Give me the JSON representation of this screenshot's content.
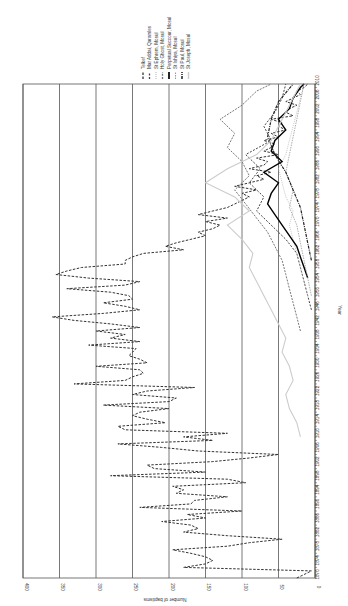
{
  "chart_data": {
    "type": "line",
    "orientation": "rotated-90-clockwise",
    "title": "",
    "xlabel": "Year",
    "ylabel": "Number of baptisms",
    "ylim": [
      0,
      400
    ],
    "xlim": [
      1870,
      2010
    ],
    "grid": "major y gridlines every 50",
    "legend_position": "top-right (rotated)",
    "y_ticks": [
      "0",
      "50",
      "100",
      "150",
      "200",
      "250",
      "300",
      "350",
      "400"
    ],
    "x_ticks": [
      "1870",
      "1874",
      "1878",
      "1882",
      "1886",
      "1890",
      "1894",
      "1898",
      "1902",
      "1906",
      "1910",
      "1914",
      "1918",
      "1922",
      "1926",
      "1930",
      "1934",
      "1938",
      "1942",
      "1946",
      "1950",
      "1954",
      "1958",
      "1962",
      "1966",
      "1970",
      "1974",
      "1978",
      "1982",
      "1986",
      "1990",
      "1994",
      "1998",
      "2002",
      "2006",
      "2010"
    ],
    "series": [
      {
        "name": "Telkef",
        "style": "dashed-dark",
        "color": "#333333",
        "x": [
          1870,
          1871,
          1872,
          1873,
          1874,
          1875,
          1876,
          1877,
          1878,
          1879,
          1880,
          1881,
          1882,
          1883,
          1884,
          1885,
          1886,
          1887,
          1888,
          1889,
          1890,
          1891,
          1892,
          1893,
          1894,
          1895,
          1896,
          1897,
          1898,
          1899,
          1900,
          1901,
          1902,
          1903,
          1904,
          1905,
          1906,
          1907,
          1908,
          1909,
          1910,
          1911,
          1912,
          1913,
          1914,
          1915,
          1916,
          1917,
          1918,
          1919,
          1920,
          1921,
          1922,
          1923,
          1924,
          1925,
          1926,
          1927,
          1928,
          1929,
          1930,
          1931,
          1932,
          1933,
          1934,
          1935,
          1936,
          1937,
          1938,
          1939,
          1940,
          1941,
          1942,
          1943,
          1944,
          1945,
          1946,
          1947,
          1948,
          1949,
          1950,
          1951,
          1952,
          1953,
          1954,
          1955,
          1956,
          1957,
          1958,
          1959,
          1960,
          1961,
          1962,
          1963,
          1964,
          1965,
          1966,
          1967,
          1968,
          1969,
          1970,
          1971,
          1972,
          1973,
          1974,
          1975,
          1976,
          1977,
          1978,
          1979,
          1980,
          1981,
          1982,
          1983,
          1984,
          1985,
          1986,
          1987,
          1988,
          1989,
          1990,
          1991,
          1992,
          1993,
          1994,
          1995,
          1996,
          1997,
          1998,
          1999,
          2000,
          2001,
          2002,
          2003,
          2004,
          2005,
          2006,
          2007,
          2008,
          2009,
          2010
        ],
        "values": [
          25,
          15,
          5,
          180,
          150,
          140,
          150,
          170,
          195,
          120,
          90,
          45,
          120,
          180,
          160,
          170,
          210,
          150,
          175,
          100,
          240,
          170,
          165,
          120,
          190,
          180,
          195,
          95,
          120,
          280,
          150,
          220,
          230,
          140,
          90,
          50,
          160,
          210,
          270,
          140,
          180,
          120,
          260,
          270,
          205,
          230,
          250,
          240,
          200,
          290,
          200,
          190,
          250,
          230,
          165,
          330,
          260,
          250,
          235,
          240,
          300,
          230,
          240,
          255,
          250,
          245,
          310,
          240,
          280,
          260,
          300,
          240,
          280,
          330,
          360,
          290,
          240,
          260,
          290,
          250,
          255,
          280,
          340,
          260,
          240,
          310,
          355,
          340,
          320,
          260,
          260,
          250,
          235,
          180,
          205,
          190,
          170,
          150,
          160,
          140,
          130,
          150,
          120,
          160,
          140,
          120,
          110,
          100,
          90,
          100,
          80,
          110,
          90,
          70,
          80,
          60,
          90,
          70,
          65,
          80,
          50,
          70,
          60,
          55,
          70,
          50,
          60,
          40,
          50,
          45,
          60,
          30,
          40,
          35,
          25,
          40,
          30,
          20,
          25,
          15,
          10
        ]
      },
      {
        "name": "Mar Addai, Qaramles",
        "style": "dashed-dark-2",
        "color": "#444444",
        "x": [
          1946,
          1950,
          1954,
          1958,
          1962,
          1966,
          1970,
          1974,
          1978,
          1982,
          1986,
          1990,
          1994,
          1998,
          2002,
          2006,
          2010
        ],
        "values": [
          5,
          10,
          15,
          20,
          25,
          40,
          60,
          80,
          70,
          90,
          75,
          95,
          60,
          70,
          55,
          45,
          40
        ]
      },
      {
        "name": "St Ephrem, Mosul",
        "style": "dotted-light",
        "color": "#bbbbbb",
        "x": [
          1950,
          1954,
          1958,
          1962,
          1966,
          1970,
          1974,
          1978,
          1982,
          1986,
          1990,
          1994,
          1998,
          2002,
          2006,
          2010
        ],
        "values": [
          10,
          15,
          20,
          25,
          30,
          35,
          30,
          40,
          45,
          50,
          40,
          35,
          30,
          25,
          20,
          15
        ]
      },
      {
        "name": "Holy Ghost, Mosul",
        "style": "dashed-mid",
        "color": "#777777",
        "x": [
          1940,
          1944,
          1948,
          1952,
          1956,
          1960,
          1964,
          1968,
          1972,
          1976,
          1980,
          1984,
          1988,
          1992,
          1996,
          2000,
          2004,
          2008,
          2010
        ],
        "values": [
          20,
          25,
          30,
          35,
          40,
          45,
          55,
          65,
          80,
          95,
          110,
          90,
          100,
          120,
          110,
          130,
          100,
          80,
          60
        ]
      },
      {
        "name": "Perpetual Succour, Mosul",
        "style": "solid-black",
        "color": "#000000",
        "x": [
          1955,
          1958,
          1961,
          1964,
          1967,
          1970,
          1973,
          1976,
          1979,
          1982,
          1985,
          1988,
          1991,
          1994,
          1997,
          2000,
          2003,
          2006,
          2009,
          2010
        ],
        "values": [
          10,
          15,
          20,
          25,
          35,
          45,
          55,
          65,
          60,
          50,
          70,
          45,
          60,
          55,
          40,
          50,
          35,
          30,
          20,
          15
        ]
      },
      {
        "name": "St Ishiya, Mosul",
        "style": "dashed-light",
        "color": "#999999",
        "x": [
          1950,
          1955,
          1960,
          1965,
          1970,
          1975,
          1980,
          1985,
          1990,
          1995,
          2000,
          2005,
          2010
        ],
        "values": [
          5,
          10,
          15,
          20,
          25,
          35,
          30,
          40,
          35,
          30,
          25,
          20,
          15
        ]
      },
      {
        "name": "St Paul, Mosul",
        "style": "dashdot-dark",
        "color": "#222222",
        "x": [
          1960,
          1965,
          1970,
          1975,
          1980,
          1985,
          1990,
          1995,
          2000,
          2005,
          2010
        ],
        "values": [
          5,
          10,
          15,
          20,
          30,
          40,
          55,
          65,
          60,
          50,
          30
        ]
      },
      {
        "name": "St Joseph, Mosul",
        "style": "solid-light",
        "color": "#cccccc",
        "x": [
          1910,
          1914,
          1918,
          1922,
          1926,
          1930,
          1934,
          1938,
          1942,
          1946,
          1950,
          1954,
          1958,
          1962,
          1966,
          1970,
          1974,
          1978,
          1982,
          1986,
          1990,
          1994,
          1998,
          2002,
          2006,
          2010
        ],
        "values": [
          20,
          25,
          35,
          40,
          30,
          35,
          45,
          40,
          50,
          60,
          70,
          80,
          90,
          85,
          100,
          120,
          90,
          110,
          150,
          120,
          80,
          60,
          50,
          40,
          30,
          20
        ]
      }
    ]
  }
}
